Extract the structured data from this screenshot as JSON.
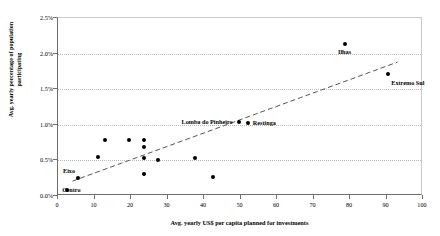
{
  "chart_data": {
    "type": "scatter",
    "title": "",
    "xlabel": "Avg. yearly US$ per capita planned for investments",
    "ylabel": "Avg. yearly percentage of population participating",
    "xlim": [
      0,
      100
    ],
    "ylim": [
      0,
      2.5
    ],
    "grid": true,
    "legend": "none",
    "x_ticks": [
      "0",
      "10",
      "20",
      "30",
      "40",
      "50",
      "60",
      "70",
      "80",
      "90",
      "100"
    ],
    "x_tick_values": [
      0,
      10,
      20,
      30,
      40,
      50,
      60,
      70,
      80,
      90,
      100
    ],
    "y_ticks": [
      "0.0%",
      "0.5%",
      "1.0%",
      "1.5%",
      "2.0%",
      "2.5%"
    ],
    "y_tick_values": [
      0.0,
      0.5,
      1.0,
      1.5,
      2.0,
      2.5
    ],
    "points": [
      {
        "label": "Centro",
        "x": 2.5,
        "y": 0.08,
        "label_dx": -5,
        "label_dy": -4,
        "anchor": "start"
      },
      {
        "label": "Eixo",
        "x": 5.5,
        "y": 0.25,
        "label_dx": -3,
        "label_dy": -11,
        "anchor": "end"
      },
      {
        "label": "",
        "x": 11.0,
        "y": 0.55,
        "label_dx": 0,
        "label_dy": 0,
        "anchor": "start"
      },
      {
        "label": "",
        "x": 13.0,
        "y": 0.78,
        "label_dx": 0,
        "label_dy": 0,
        "anchor": "start"
      },
      {
        "label": "",
        "x": 19.5,
        "y": 0.78,
        "label_dx": 0,
        "label_dy": 0,
        "anchor": "start"
      },
      {
        "label": "",
        "x": 23.5,
        "y": 0.79,
        "label_dx": 0,
        "label_dy": 0,
        "anchor": "start"
      },
      {
        "label": "",
        "x": 23.5,
        "y": 0.69,
        "label_dx": 0,
        "label_dy": 0,
        "anchor": "start"
      },
      {
        "label": "",
        "x": 23.5,
        "y": 0.54,
        "label_dx": 0,
        "label_dy": 0,
        "anchor": "start"
      },
      {
        "label": "",
        "x": 23.5,
        "y": 0.31,
        "label_dx": 0,
        "label_dy": 0,
        "anchor": "start"
      },
      {
        "label": "",
        "x": 27.5,
        "y": 0.5,
        "label_dx": 0,
        "label_dy": 0,
        "anchor": "start"
      },
      {
        "label": "",
        "x": 37.5,
        "y": 0.53,
        "label_dx": 0,
        "label_dy": 0,
        "anchor": "start"
      },
      {
        "label": "",
        "x": 42.5,
        "y": 0.27,
        "label_dx": 0,
        "label_dy": 0,
        "anchor": "start"
      },
      {
        "label": "Lomba do Pinheiro",
        "x": 49.5,
        "y": 1.04,
        "label_dx": -6,
        "label_dy": -4,
        "anchor": "end"
      },
      {
        "label": "Restinga",
        "x": 52.0,
        "y": 1.02,
        "label_dx": 5,
        "label_dy": -4,
        "anchor": "start"
      },
      {
        "label": "Ilhas",
        "x": 78.5,
        "y": 2.13,
        "label_dx": 0,
        "label_dy": 4,
        "anchor": "mid"
      },
      {
        "label": "Extremo Sul",
        "x": 90.5,
        "y": 1.71,
        "label_dx": 3,
        "label_dy": 5,
        "anchor": "start"
      }
    ],
    "trendline": {
      "style": "dashed",
      "color": "#555555",
      "x_start": 4.0,
      "y_start": 0.21,
      "x_end": 93.0,
      "y_end": 1.88
    }
  }
}
